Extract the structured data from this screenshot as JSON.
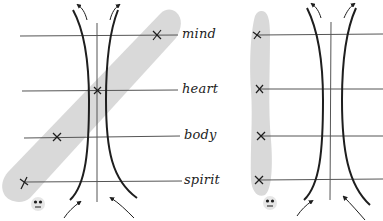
{
  "diagram": {
    "type": "hand-drawn comparison diagram",
    "colors": {
      "ink": "#1e1e1e",
      "line": "#555555",
      "band": "#d9d9d9",
      "background": "#ffffff"
    },
    "labels": [
      "mind",
      "heart",
      "body",
      "spirit"
    ],
    "left_panel": {
      "description": "hourglass flow with diagonal gray band; x marks placed diagonally",
      "levels": [
        {
          "label": "mind",
          "y": 35,
          "mark_x": 157
        },
        {
          "label": "heart",
          "y": 91,
          "mark_x": 97
        },
        {
          "label": "body",
          "y": 137,
          "mark_x": 57
        },
        {
          "label": "spirit",
          "y": 182,
          "mark_x": 24
        }
      ],
      "face_icon": "face-icon"
    },
    "right_panel": {
      "description": "hourglass flow with vertical gray band; x marks aligned vertically",
      "levels": [
        {
          "label": "mind",
          "y": 35,
          "mark_x": 257
        },
        {
          "label": "heart",
          "y": 89,
          "mark_x": 259
        },
        {
          "label": "body",
          "y": 136,
          "mark_x": 261
        },
        {
          "label": "spirit",
          "y": 180,
          "mark_x": 259
        }
      ],
      "face_icon": "face-icon"
    }
  }
}
